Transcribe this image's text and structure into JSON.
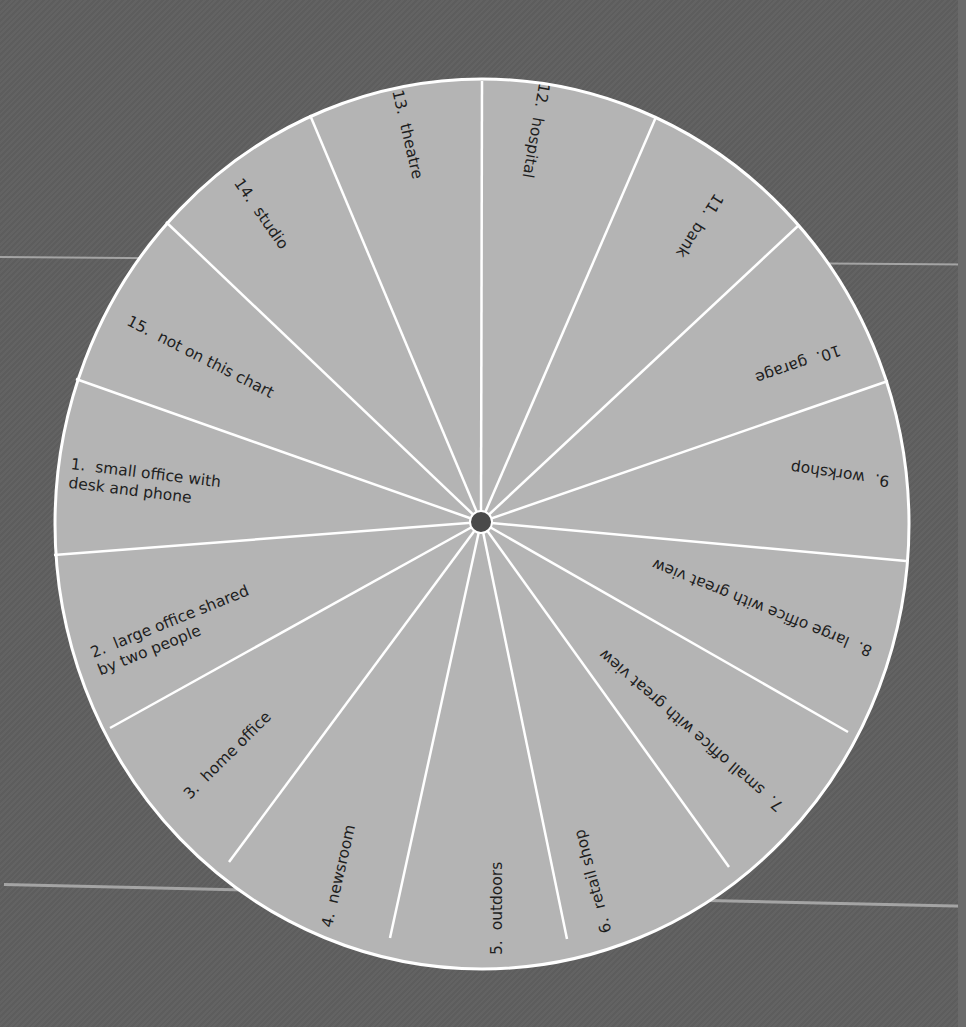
{
  "wheel": {
    "center": [
      481,
      522
    ],
    "rx": 427,
    "ry": 445,
    "fill": "#b4b4b4",
    "stroke": "#ffffff",
    "hub_color": "#4a4a4a",
    "background": "#5e5e5e",
    "boundaries": [
      [
        482,
        81
      ],
      [
        656,
        117
      ],
      [
        799,
        225
      ],
      [
        888,
        381
      ],
      [
        906,
        561
      ],
      [
        848,
        732
      ],
      [
        729,
        867
      ],
      [
        567,
        939
      ],
      [
        390,
        938
      ],
      [
        229,
        862
      ],
      [
        110,
        728
      ],
      [
        54,
        555
      ],
      [
        76,
        379
      ],
      [
        166,
        222
      ],
      [
        310,
        115
      ]
    ],
    "segments": [
      {
        "number": "1.",
        "label": "small office with\ndesk and phone",
        "text": "1.  small office with\ndesk and phone"
      },
      {
        "number": "2.",
        "label": "large office shared by two people",
        "text": "2.  large office shared\nby two people"
      },
      {
        "number": "3.",
        "label": "home office",
        "text": "3.  home office"
      },
      {
        "number": "4.",
        "label": "newsroom",
        "text": "4.  newsroom"
      },
      {
        "number": "5.",
        "label": "outdoors",
        "text": "5.  outdoors"
      },
      {
        "number": "6.",
        "label": "retail shop",
        "text": "6.  retail shop"
      },
      {
        "number": "7.",
        "label": "small office with great view",
        "text": "7.  small office with great view"
      },
      {
        "number": "8.",
        "label": "large office with great view",
        "text": "8.  large office with great view"
      },
      {
        "number": "9.",
        "label": "workshop",
        "text": "9.  workshop"
      },
      {
        "number": "10.",
        "label": "garage",
        "text": "10.  garage"
      },
      {
        "number": "11.",
        "label": "bank",
        "text": "11.  bank"
      },
      {
        "number": "12.",
        "label": "hospital",
        "text": "12.  hospital"
      },
      {
        "number": "13.",
        "label": "theatre",
        "text": "13.  theatre"
      },
      {
        "number": "14.",
        "label": "studio",
        "text": "14.  studio"
      },
      {
        "number": "15.",
        "label": "not on this chart",
        "text": "15.  not on this chart"
      }
    ]
  }
}
